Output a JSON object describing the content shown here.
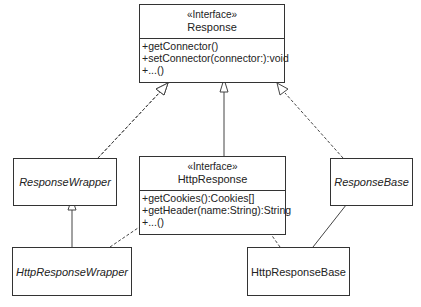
{
  "diagram": {
    "type": "uml-class-diagram",
    "classes": {
      "response": {
        "stereotype": "«Interface»",
        "name": "Response",
        "operations": [
          "+getConnector()",
          "+setConnector(connector:):void",
          "+...()"
        ]
      },
      "http_response": {
        "stereotype": "«Interface»",
        "name": "HttpResponse",
        "operations": [
          "+getCookies():Cookies[]",
          "+getHeader(name:String):String",
          "+...()"
        ]
      },
      "response_wrapper": {
        "name": "ResponseWrapper",
        "abstract": true
      },
      "response_base": {
        "name": "ResponseBase",
        "abstract": true
      },
      "http_response_wrapper": {
        "name": "HttpResponseWrapper",
        "abstract": true
      },
      "http_response_base": {
        "name": "HttpResponseBase",
        "abstract": false
      }
    },
    "relationships": [
      {
        "from": "ResponseWrapper",
        "to": "Response",
        "kind": "realization"
      },
      {
        "from": "HttpResponse",
        "to": "Response",
        "kind": "generalization"
      },
      {
        "from": "ResponseBase",
        "to": "Response",
        "kind": "realization"
      },
      {
        "from": "HttpResponseWrapper",
        "to": "ResponseWrapper",
        "kind": "generalization"
      },
      {
        "from": "HttpResponseWrapper",
        "to": "HttpResponse",
        "kind": "realization"
      },
      {
        "from": "HttpResponseBase",
        "to": "HttpResponse",
        "kind": "realization"
      },
      {
        "from": "HttpResponseBase",
        "to": "ResponseBase",
        "kind": "generalization"
      }
    ],
    "colors": {
      "line": "#333333",
      "background": "#ffffff"
    }
  }
}
